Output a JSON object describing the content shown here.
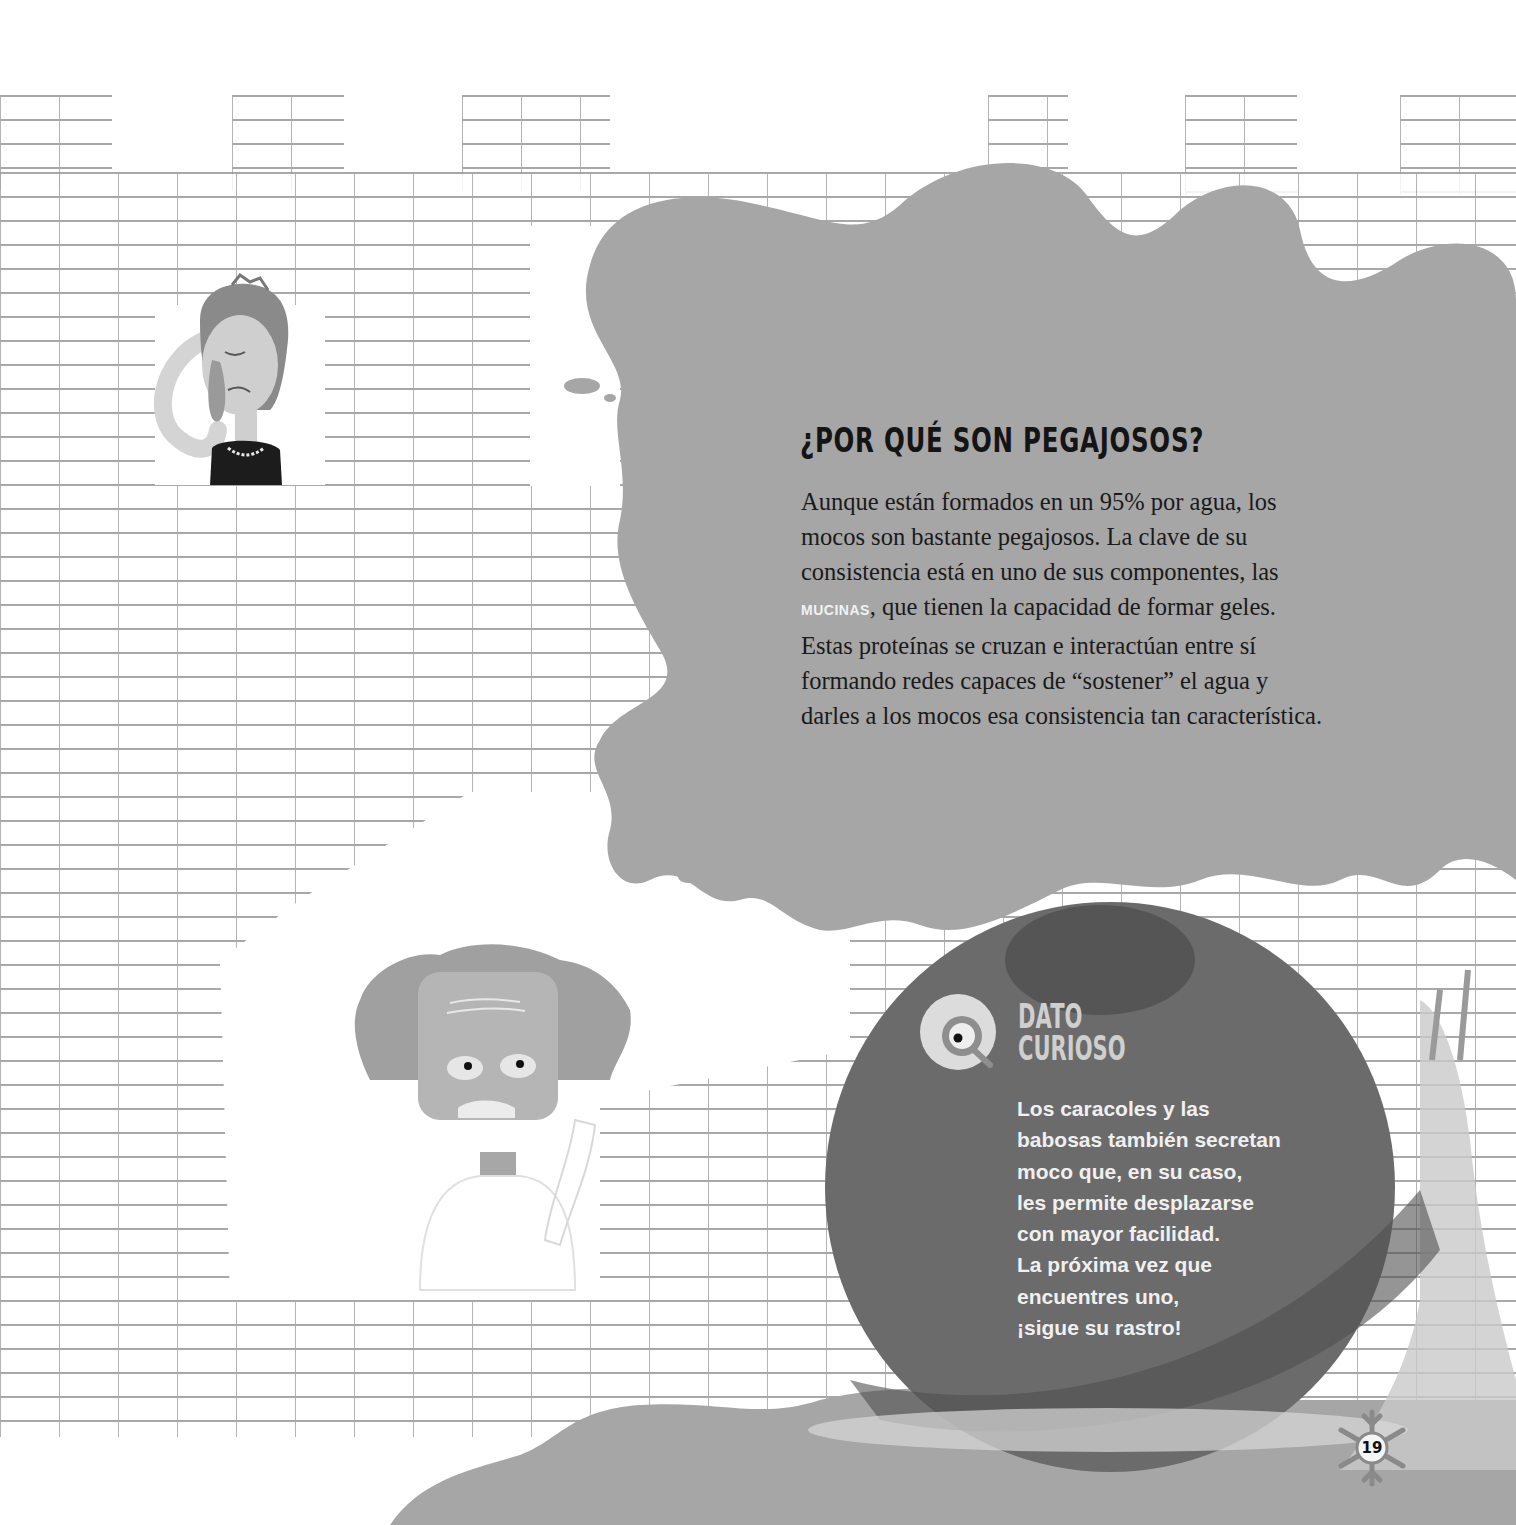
{
  "page": {
    "number": "19",
    "colors": {
      "background": "#ffffff",
      "brick_lines": "#9a9a9a",
      "blob": "#a6a6a6",
      "dark_circle": "#6b6b6b",
      "heading_text": "#141414",
      "body_text": "#1a1a1a",
      "highlight_word": "#f2f2f2",
      "dato_title": "#cfcfcf",
      "dato_text": "#f0f0f0"
    }
  },
  "main_section": {
    "heading": "¿POR QUÉ SON PEGAJOSOS?",
    "paragraph_lines": [
      "Aunque están formados en un 95% por agua, los",
      "mocos son bastante pegajosos. La clave de su",
      "consistencia está en uno de sus componentes, las",
      "{MUCINAS}, que tienen la capacidad de formar geles.",
      "Estas proteínas se cruzan e interactúan entre sí",
      "formando redes capaces de “sostener” el agua y",
      "darles a los mocos esa consistencia tan característica."
    ],
    "line1": "Aunque están formados en un 95% por agua, los",
    "line2": "mocos son bastante pegajosos. La clave de su",
    "line3": "consistencia está en uno de sus componentes, las",
    "keyword": "MUCINAS",
    "line4_rest": ", que tienen la capacidad de formar geles.",
    "line5": "Estas proteínas se cruzan e interactúan entre sí",
    "line6": "formando redes capaces de “sostener” el agua y",
    "line7": "darles a los mocos esa consistencia tan característica."
  },
  "dato_curioso": {
    "icon": "magnifier-eye-icon",
    "title_line1": "DATO",
    "title_line2": "CURIOSO",
    "lines": [
      "Los caracoles y las",
      "babosas también secretan",
      "moco que, en su caso,",
      "les permite desplazarse",
      "con mayor facilidad.",
      "La próxima vez que",
      "encuentres uno,",
      "¡sigue su rastro!"
    ]
  },
  "illustrations": {
    "queen": "crying-queen-with-tiara",
    "scientist": "scientist-with-wild-hair-picking-nose",
    "snail": "snail-with-dark-shell",
    "wall": "castle-brick-wall"
  },
  "footer": {
    "page_number": "19",
    "page_badge_icon": "snowflake-icon"
  }
}
